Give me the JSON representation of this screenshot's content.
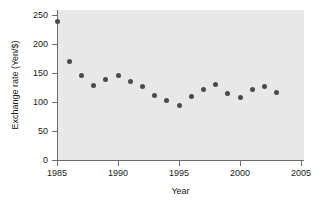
{
  "chart_data": {
    "type": "scatter",
    "title": "",
    "xlabel": "Year",
    "ylabel": "Exchange rate (Yen/$)",
    "xlim": [
      1984,
      2005.5
    ],
    "ylim": [
      0,
      255
    ],
    "xticks": [
      1985,
      1990,
      1995,
      2000,
      2005
    ],
    "yticks": [
      0,
      50,
      100,
      150,
      200,
      250
    ],
    "xtick_labels": [
      "1985",
      "1990",
      "1995",
      "2000",
      "2005"
    ],
    "ytick_labels": [
      "0",
      "50",
      "100",
      "150",
      "200",
      "250"
    ],
    "grid": false,
    "legend": "none",
    "marker_color": "#4a4a4a",
    "panel_color": "#e8e8e8",
    "axis_color": "#6d6d6d",
    "x": [
      1985,
      1986,
      1987,
      1988,
      1989,
      1990,
      1991,
      1992,
      1993,
      1994,
      1995,
      1996,
      1997,
      1998,
      1999,
      2000,
      2001,
      2002,
      2003
    ],
    "values": [
      239,
      170,
      146,
      129,
      138,
      146,
      135,
      127,
      111,
      102,
      94,
      110,
      121,
      131,
      114,
      108,
      122,
      126,
      116
    ],
    "points": [
      {
        "year": 1985,
        "rate": 239
      },
      {
        "year": 1986,
        "rate": 170
      },
      {
        "year": 1987,
        "rate": 146
      },
      {
        "year": 1988,
        "rate": 129
      },
      {
        "year": 1989,
        "rate": 138
      },
      {
        "year": 1990,
        "rate": 146
      },
      {
        "year": 1991,
        "rate": 135
      },
      {
        "year": 1992,
        "rate": 127
      },
      {
        "year": 1993,
        "rate": 111
      },
      {
        "year": 1994,
        "rate": 102
      },
      {
        "year": 1995,
        "rate": 94
      },
      {
        "year": 1996,
        "rate": 110
      },
      {
        "year": 1997,
        "rate": 121
      },
      {
        "year": 1998,
        "rate": 131
      },
      {
        "year": 1999,
        "rate": 114
      },
      {
        "year": 2000,
        "rate": 108
      },
      {
        "year": 2001,
        "rate": 122
      },
      {
        "year": 2002,
        "rate": 126
      },
      {
        "year": 2003,
        "rate": 116
      }
    ]
  }
}
